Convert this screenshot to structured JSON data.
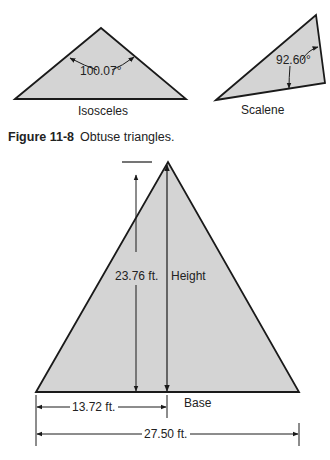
{
  "figure_top": {
    "caption_number": "Figure 11-8",
    "caption_text": "Obtuse triangles.",
    "isosceles": {
      "label": "Isosceles",
      "angle": "100.07°"
    },
    "scalene": {
      "label": "Scalene",
      "angle": "92.60°"
    }
  },
  "figure_bottom": {
    "height_value": "23.76 ft.",
    "height_label": "Height",
    "base_label": "Base",
    "half_base": "13.72 ft.",
    "full_base": "27.50 ft."
  },
  "colors": {
    "fill": "#d4d4d4",
    "stroke": "#1a1a1a"
  }
}
